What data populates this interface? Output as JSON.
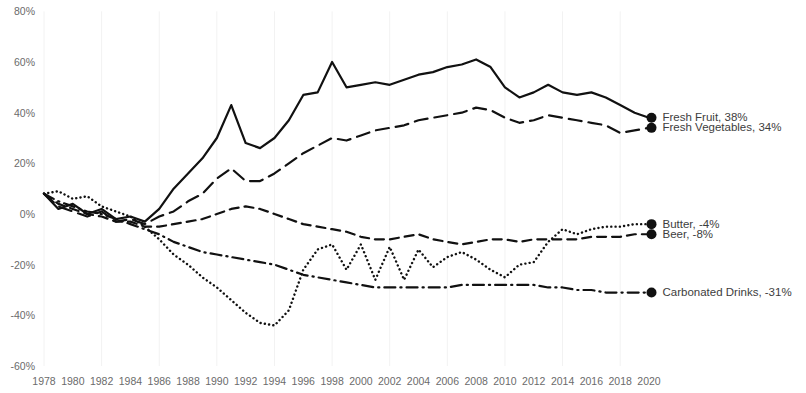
{
  "chart_data": {
    "type": "line",
    "title": "",
    "subtitle": "",
    "xlabel": "",
    "ylabel": "",
    "xlim": [
      1978,
      2020
    ],
    "ylim": [
      -60,
      80
    ],
    "grid": "vertical-faint",
    "legend_position": "right-end-of-line",
    "y_ticks": [
      "80%",
      "60%",
      "40%",
      "20%",
      "0%",
      "-20%",
      "-40%",
      "-60%"
    ],
    "y_tick_values": [
      80,
      60,
      40,
      20,
      0,
      -20,
      -40,
      -60
    ],
    "x_ticks": [
      "1978",
      "1980",
      "1982",
      "1984",
      "1986",
      "1988",
      "1990",
      "1992",
      "1994",
      "1996",
      "1998",
      "2000",
      "2002",
      "2004",
      "2006",
      "2008",
      "2010",
      "2012",
      "2014",
      "2016",
      "2018",
      "2020"
    ],
    "x_tick_values": [
      1978,
      1980,
      1982,
      1984,
      1986,
      1988,
      1990,
      1992,
      1994,
      1996,
      1998,
      2000,
      2002,
      2004,
      2006,
      2008,
      2010,
      2012,
      2014,
      2016,
      2018,
      2020
    ],
    "x": [
      1978,
      1979,
      1980,
      1981,
      1982,
      1983,
      1984,
      1985,
      1986,
      1987,
      1988,
      1989,
      1990,
      1991,
      1992,
      1993,
      1994,
      1995,
      1996,
      1997,
      1998,
      1999,
      2000,
      2001,
      2002,
      2003,
      2004,
      2005,
      2006,
      2007,
      2008,
      2009,
      2010,
      2011,
      2012,
      2013,
      2014,
      2015,
      2016,
      2017,
      2018,
      2019,
      2020
    ],
    "series": [
      {
        "name": "Fresh Fruit",
        "end_value": 38,
        "end_label": "Fresh Fruit, 38%",
        "color": "#111111",
        "dash": "solid",
        "width": 2.2,
        "values": [
          8,
          2,
          4,
          0,
          2,
          -2,
          -1,
          -3,
          2,
          10,
          16,
          22,
          30,
          43,
          28,
          26,
          30,
          37,
          47,
          48,
          60,
          50,
          51,
          52,
          51,
          53,
          55,
          56,
          58,
          59,
          61,
          58,
          50,
          46,
          48,
          51,
          48,
          47,
          48,
          46,
          43,
          40,
          38
        ]
      },
      {
        "name": "Fresh Vegetables",
        "end_value": 34,
        "end_label": "Fresh Vegetables, 34%",
        "color": "#111111",
        "dash": "dashed-long",
        "width": 2.2,
        "values": [
          8,
          3,
          1,
          -1,
          1,
          -3,
          -2,
          -4,
          -1,
          1,
          5,
          8,
          14,
          18,
          13,
          13,
          16,
          20,
          24,
          27,
          30,
          29,
          31,
          33,
          34,
          35,
          37,
          38,
          39,
          40,
          42,
          41,
          38,
          36,
          37,
          39,
          38,
          37,
          36,
          35,
          32,
          33,
          34
        ]
      },
      {
        "name": "Butter",
        "end_value": -4,
        "end_label": "Butter, -4%",
        "color": "#111111",
        "dash": "dotted",
        "width": 2.4,
        "values": [
          8,
          9,
          6,
          7,
          3,
          1,
          -1,
          -5,
          -10,
          -16,
          -20,
          -25,
          -29,
          -34,
          -39,
          -43,
          -44,
          -38,
          -22,
          -14,
          -12,
          -22,
          -12,
          -26,
          -13,
          -26,
          -14,
          -21,
          -17,
          -15,
          -18,
          -22,
          -25,
          -20,
          -19,
          -11,
          -6,
          -8,
          -6,
          -5,
          -5,
          -4,
          -4
        ]
      },
      {
        "name": "Beer",
        "end_value": -8,
        "end_label": "Beer, -8%",
        "color": "#111111",
        "dash": "dashed-short",
        "width": 2.2,
        "values": [
          8,
          4,
          2,
          0,
          -1,
          -3,
          -3,
          -5,
          -5,
          -4,
          -3,
          -2,
          0,
          2,
          3,
          2,
          0,
          -2,
          -4,
          -5,
          -6,
          -7,
          -9,
          -10,
          -10,
          -9,
          -8,
          -10,
          -11,
          -12,
          -11,
          -10,
          -10,
          -11,
          -10,
          -10,
          -10,
          -10,
          -9,
          -9,
          -9,
          -8,
          -8
        ]
      },
      {
        "name": "Carbonated Drinks",
        "end_value": -31,
        "end_label": "Carbonated Drinks, -31%",
        "color": "#111111",
        "dash": "dash-dot",
        "width": 2.2,
        "values": [
          8,
          5,
          3,
          1,
          0,
          -2,
          -4,
          -6,
          -8,
          -11,
          -13,
          -15,
          -16,
          -17,
          -18,
          -19,
          -20,
          -22,
          -24,
          -25,
          -26,
          -27,
          -28,
          -29,
          -29,
          -29,
          -29,
          -29,
          -29,
          -28,
          -28,
          -28,
          -28,
          -28,
          -28,
          -29,
          -29,
          -30,
          -30,
          -31,
          -31,
          -31,
          -31
        ]
      }
    ]
  }
}
